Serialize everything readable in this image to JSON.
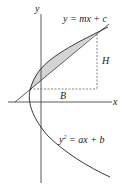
{
  "diagram": {
    "labels": {
      "y_axis": "y",
      "x_axis": "x",
      "line_eq": "y = mx + c",
      "parabola_eq_lhs": "y",
      "parabola_eq_exp": "2",
      "parabola_eq_rhs": " = ax + b",
      "height": "H",
      "base": "B"
    },
    "colors": {
      "stroke": "#222222",
      "shade": "#d4d4d4",
      "axis": "#333333",
      "dashed": "#555555"
    }
  }
}
